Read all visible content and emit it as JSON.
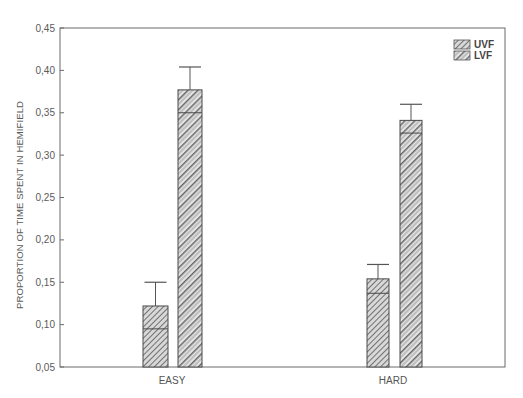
{
  "chart_data": {
    "type": "bar",
    "title": "",
    "xlabel": "",
    "ylabel": "PROPORTION OF TIME SPENT IN HEMIFIELD",
    "ylim": [
      0.05,
      0.45
    ],
    "yticks": [
      "0,05",
      "0,10",
      "0,15",
      "0,20",
      "0,25",
      "0,30",
      "0,35",
      "0,40",
      "0,45"
    ],
    "ytick_values": [
      0.05,
      0.1,
      0.15,
      0.2,
      0.25,
      0.3,
      0.35,
      0.4,
      0.45
    ],
    "categories": [
      "EASY",
      "HARD"
    ],
    "grid": false,
    "legend_position": "upper right",
    "series": [
      {
        "name": "UVF",
        "values": [
          0.122,
          0.154
        ],
        "box_lower": [
          0.095,
          0.137
        ],
        "whisker_upper": [
          0.15,
          0.171
        ],
        "pattern": "dense-diagonal-hatch"
      },
      {
        "name": "LVF",
        "values": [
          0.377,
          0.341
        ],
        "box_lower": [
          0.35,
          0.326
        ],
        "whisker_upper": [
          0.404,
          0.36
        ],
        "pattern": "wide-diagonal-hatch"
      }
    ]
  },
  "legend": {
    "items": [
      {
        "label": "UVF"
      },
      {
        "label": "LVF"
      }
    ]
  },
  "axes": {
    "y_title": "PROPORTION OF TIME SPENT IN HEMIFIELD",
    "x_labels": [
      "EASY",
      "HARD"
    ]
  },
  "colors": {
    "axis": "#6a6a6a",
    "bar_edge": "#4a4a4a",
    "hatch": "#5a5a5a",
    "background": "#ffffff"
  }
}
